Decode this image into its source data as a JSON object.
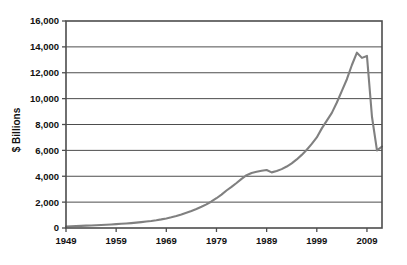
{
  "chart_data": {
    "type": "line",
    "title": "",
    "subtitle": "",
    "xlabel": "",
    "ylabel": "$ Billions",
    "xlim": [
      1949,
      2012
    ],
    "ylim": [
      0,
      16000
    ],
    "grid": true,
    "legend": false,
    "legend_position": "none",
    "x_ticks": [
      "1949",
      "1959",
      "1969",
      "1979",
      "1989",
      "1999",
      "2009"
    ],
    "x_tick_values": [
      1949,
      1959,
      1969,
      1979,
      1989,
      1999,
      2009
    ],
    "y_ticks": [
      "0",
      "2,000",
      "4,000",
      "6,000",
      "8,000",
      "10,000",
      "12,000",
      "14,000",
      "16,000"
    ],
    "y_tick_values": [
      0,
      2000,
      4000,
      6000,
      8000,
      10000,
      12000,
      14000,
      16000
    ],
    "series": [
      {
        "name": "$ Billions",
        "color": "#808080",
        "x": [
          1949,
          1950,
          1951,
          1952,
          1953,
          1954,
          1955,
          1956,
          1957,
          1958,
          1959,
          1960,
          1961,
          1962,
          1963,
          1964,
          1965,
          1966,
          1967,
          1968,
          1969,
          1970,
          1971,
          1972,
          1973,
          1974,
          1975,
          1976,
          1977,
          1978,
          1979,
          1980,
          1981,
          1982,
          1983,
          1984,
          1985,
          1986,
          1987,
          1988,
          1989,
          1990,
          1991,
          1992,
          1993,
          1994,
          1995,
          1996,
          1997,
          1998,
          1999,
          2000,
          2001,
          2002,
          2003,
          2004,
          2005,
          2006,
          2007,
          2008,
          2009,
          2010,
          2011,
          2012
        ],
        "values": [
          120,
          135,
          150,
          165,
          180,
          195,
          215,
          235,
          255,
          275,
          300,
          325,
          350,
          380,
          415,
          455,
          500,
          545,
          600,
          665,
          740,
          830,
          930,
          1050,
          1180,
          1320,
          1470,
          1640,
          1830,
          2050,
          2300,
          2580,
          2900,
          3180,
          3480,
          3800,
          4080,
          4250,
          4350,
          4420,
          4480,
          4300,
          4400,
          4550,
          4750,
          5000,
          5300,
          5650,
          6050,
          6500,
          7000,
          7700,
          8300,
          8900,
          9700,
          10600,
          11500,
          12600,
          13550,
          13150,
          13300,
          8600,
          6000,
          6300
        ]
      }
    ],
    "annotations": []
  },
  "axis": {
    "y_title": "$ Billions"
  },
  "style": {
    "line_color": "#808080",
    "grid_color": "#4d4d4d",
    "frame_color": "#4d4d4d",
    "background": "#ffffff"
  }
}
